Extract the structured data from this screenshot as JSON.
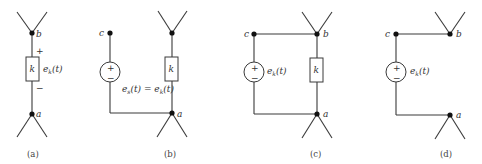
{
  "figure": {
    "panels": [
      {
        "id": "a",
        "caption": "(a)",
        "nodes": {
          "top": "b",
          "bottom": "a"
        },
        "element_label": "k",
        "voltage_label": "e",
        "voltage_sub": "k",
        "voltage_arg": "(t)",
        "plus": "+",
        "minus": "−"
      },
      {
        "id": "b",
        "caption": "(b)",
        "nodes": {
          "source_top": "c",
          "top": "b",
          "bottom": "a"
        },
        "element_label": "k",
        "source_plus": "+",
        "source_minus": "−",
        "equation": "e",
        "equation_sub": "s",
        "equation_mid": "(t) = e",
        "equation_sub2": "k",
        "equation_end": "(t)"
      },
      {
        "id": "c",
        "caption": "(c)",
        "nodes": {
          "source_top": "c",
          "top": "b",
          "bottom": "a"
        },
        "element_label": "k",
        "source_plus": "+",
        "source_minus": "−",
        "source_label": "e",
        "source_sub": "k",
        "source_arg": "(t)"
      },
      {
        "id": "d",
        "caption": "(d)",
        "nodes": {
          "source_top": "c",
          "top": "b",
          "bottom": "a"
        },
        "source_plus": "+",
        "source_minus": "−",
        "source_label": "e",
        "source_sub": "k",
        "source_arg": "(t)"
      }
    ]
  }
}
